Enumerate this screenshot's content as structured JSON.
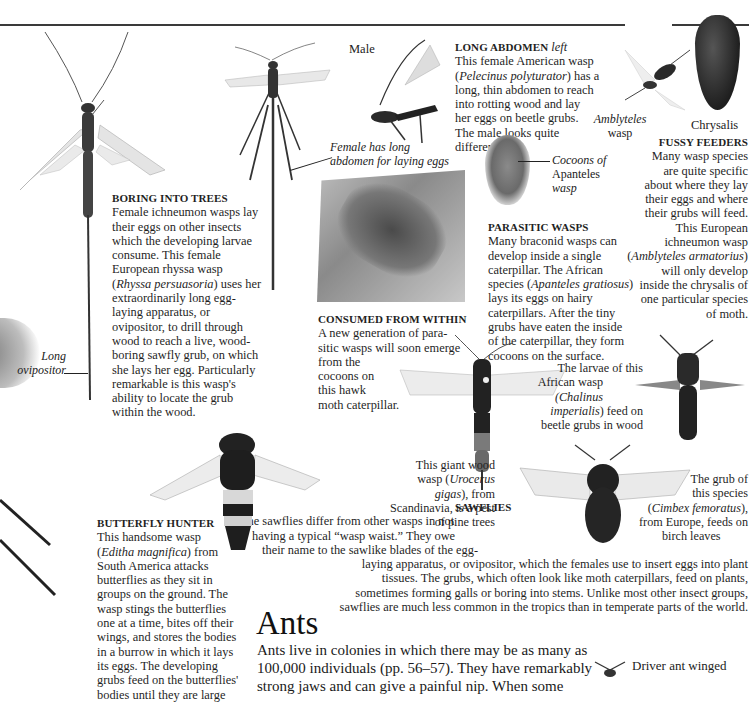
{
  "page": {
    "sections": {
      "boring_into_trees": {
        "heading": "BORING INTO TREES",
        "lines": [
          "Female ichneumon wasps lay",
          "their eggs on other insects",
          "which the developing larvae",
          "consume. This female",
          "European rhyssa wasp",
          "(Rhyssa persuasoria) uses her",
          "extraordinarily long egg-",
          "laying apparatus, or",
          "ovipositor, to drill through",
          "wood to reach a live, wood-",
          "boring sawfly grub, on which",
          "she lays her egg. Particularly",
          "remarkable is this wasp's",
          "ability to locate the grub",
          "within the wood."
        ],
        "species": "Rhyssa persuasoria"
      },
      "long_abdomen": {
        "heading": "LONG ABDOMEN",
        "heading_suffix": "left",
        "lines": [
          "This female American wasp",
          "(Pelecinus polyturator) has a",
          "long, thin abdomen to reach",
          "into rotting wood and lay",
          "her eggs on beetle grubs.",
          "The male looks quite",
          "different."
        ],
        "species": "Pelecinus polyturator"
      },
      "fussy_feeders": {
        "heading": "FUSSY FEEDERS",
        "lines": [
          "Many wasp species",
          "are quite specific",
          "about where they lay",
          "their eggs and where",
          "their grubs will feed.",
          "This European",
          "ichneumon wasp",
          "(Amblyteles armatorius)",
          "will only develop",
          "inside the chrysalis of",
          "one particular species",
          "of moth."
        ],
        "species": "Amblyteles armatorius"
      },
      "parasitic_wasps": {
        "heading": "PARASITIC WASPS",
        "lines": [
          "Many braconid wasps can",
          "develop inside a single",
          "caterpillar. The African",
          "species (Apanteles gratiosus)",
          "lays its eggs on hairy",
          "caterpillars. After the tiny",
          "grubs have eaten the inside",
          "of the caterpillar, they form",
          "cocoons on the surface."
        ],
        "species": "Apanteles gratiosus"
      },
      "consumed_from_within": {
        "heading": "CONSUMED FROM WITHIN",
        "lines": [
          "A new generation of para-",
          "sitic wasps will soon emerge",
          "from the",
          "cocoons on",
          "this hawk",
          "moth caterpillar."
        ]
      },
      "butterfly_hunter": {
        "heading": "BUTTERFLY HUNTER",
        "lines": [
          "This handsome wasp",
          "(Editha magnifica) from",
          "South America attacks",
          "butterflies as they sit in",
          "groups on the ground. The",
          "wasp stings the butterflies",
          "one at a time, bites off their",
          "wings, and stores the bodies",
          "in a burrow in which it lays",
          "its eggs. The developing",
          "grubs feed on the butterflies'",
          "bodies until they are large"
        ],
        "species": "Editha magnifica"
      },
      "sawflies": {
        "heading": "SAWFLIES",
        "lines": [
          "The sawflies differ from other wasps in not",
          "having a typical “wasp waist.” They owe",
          "their name to the sawlike blades of the egg-",
          "laying apparatus, or ovipositor, which the females use to insert eggs into plant",
          "tissues. The grubs, which often look like moth caterpillars, feed on plants,",
          "sometimes forming galls or boring into stems. Unlike most other insect groups,",
          "sawflies are much less common in the tropics than in temperate parts of the world."
        ]
      },
      "ants": {
        "title": "Ants",
        "lines": [
          "Ants live in colonies in which there may be as many as",
          "100,000 individuals (pp. 56–57). They have remarkably",
          "strong jaws and can give a painful nip. When some"
        ]
      }
    },
    "captions": {
      "male": "Male",
      "female_long_abdomen": [
        "Female has long",
        "abdomen for laying eggs"
      ],
      "long_ovipositor": [
        "Long",
        "ovipositor"
      ],
      "amblyteles_wasp": [
        "Amblyteles",
        "wasp"
      ],
      "chrysalis": "Chrysalis",
      "cocoons": [
        "Cocoons of",
        "Apanteles",
        "wasp"
      ],
      "chalinus": [
        "The larvae of this",
        "African wasp",
        "(Chalinus",
        "imperialis) feed on",
        "beetle grubs in wood"
      ],
      "urocerus": [
        "This giant wood",
        "wasp (Urocerus",
        "gigas), from",
        "Scandinavia, is a pest",
        "of pine trees"
      ],
      "cimbex": [
        "The grub of",
        "this species",
        "(Cimbex femoratus),",
        "from Europe, feeds on",
        "birch leaves"
      ],
      "driver_ant": "Driver ant winged"
    },
    "images": [
      "rhyssa-wasp-photo",
      "pelecinus-female-photo",
      "pelecinus-male-photo",
      "amblyteles-wasp-photo",
      "chrysalis-photo",
      "apanteles-cocoons-photo",
      "hawk-moth-caterpillar-photo",
      "urocerus-wood-wasp-photo",
      "chalinus-wasp-photo",
      "cimbex-sawfly-photo",
      "editha-wasp-photo",
      "driver-ant-photo"
    ]
  }
}
